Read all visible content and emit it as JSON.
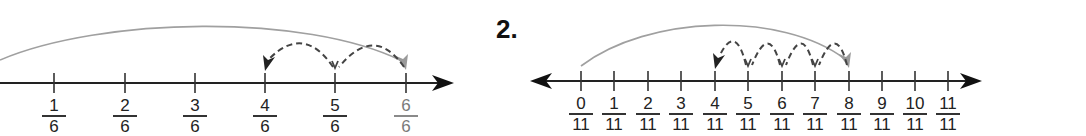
{
  "problems": [
    {
      "number": "",
      "denominator": 6,
      "axis": {
        "y": 83,
        "x_start": 0,
        "x_end": 454,
        "left_arrow": false,
        "right_arrow": true
      },
      "ticks": [
        {
          "x": 54,
          "num": "1",
          "den": "6"
        },
        {
          "x": 125,
          "num": "2",
          "den": "6"
        },
        {
          "x": 195,
          "num": "3",
          "den": "6"
        },
        {
          "x": 265,
          "num": "4",
          "den": "6"
        },
        {
          "x": 335,
          "num": "5",
          "den": "6"
        },
        {
          "x": 406,
          "num": "6",
          "den": "6",
          "highlight": "gray"
        }
      ],
      "long_jump": {
        "from_x": 0,
        "from_y": 60,
        "to_x": 406,
        "peak_y": 19,
        "color": "#9a9a9a"
      },
      "back_jumps": {
        "from_x": 406,
        "to_x": 265,
        "stops_x": [
          406,
          335,
          265
        ],
        "peak_y": 38,
        "color": "#444444"
      }
    },
    {
      "number": "2.",
      "denominator": 11,
      "axis": {
        "y": 81,
        "x_start": 530,
        "x_end": 982,
        "left_arrow": true,
        "right_arrow": true
      },
      "ticks": [
        {
          "x": 581,
          "num": "0",
          "den": "11"
        },
        {
          "x": 614,
          "num": "1",
          "den": "11"
        },
        {
          "x": 648,
          "num": "2",
          "den": "11"
        },
        {
          "x": 681,
          "num": "3",
          "den": "11"
        },
        {
          "x": 715,
          "num": "4",
          "den": "11"
        },
        {
          "x": 748,
          "num": "5",
          "den": "11"
        },
        {
          "x": 782,
          "num": "6",
          "den": "11"
        },
        {
          "x": 815,
          "num": "7",
          "den": "11"
        },
        {
          "x": 849,
          "num": "8",
          "den": "11"
        },
        {
          "x": 882,
          "num": "9",
          "den": "11"
        },
        {
          "x": 915,
          "num": "10",
          "den": "11"
        },
        {
          "x": 948,
          "num": "11",
          "den": "11"
        }
      ],
      "long_jump": {
        "from_x": 581,
        "from_y": 66,
        "to_x": 849,
        "peak_y": 17,
        "color": "#9a9a9a"
      },
      "back_jumps": {
        "from_x": 849,
        "to_x": 715,
        "stops_x": [
          849,
          815,
          782,
          748,
          715
        ],
        "peak_y": 36,
        "color": "#444444"
      }
    }
  ],
  "colors": {
    "axis": "#222222",
    "tick": "#333333",
    "long_jump": "#a0a0a0",
    "back_jump": "#444444",
    "arrow_light": "#9a9a9a"
  }
}
